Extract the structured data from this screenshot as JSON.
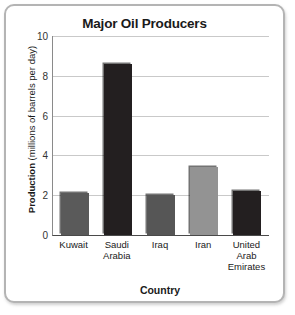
{
  "chart_data": {
    "type": "bar",
    "title": "Major Oil Producers",
    "xlabel": "Country",
    "ylabel": "Production (millions of barrels per day)",
    "ylabel_bold_part": "Production",
    "ylabel_rest": " (millions of barrels per day)",
    "categories": [
      "Kuwait",
      "Saudi Arabia",
      "Iraq",
      "Iran",
      "United Arab Emirates"
    ],
    "values": [
      2.1,
      8.6,
      2.0,
      3.4,
      2.2
    ],
    "bar_colors": [
      "#5a5a5a",
      "#231f20",
      "#565656",
      "#939393",
      "#231f20"
    ],
    "ylim": [
      0,
      10
    ],
    "yticks": [
      0,
      2,
      4,
      6,
      8,
      10
    ],
    "ytick_labels": [
      "0",
      "2",
      "4",
      "6",
      "8",
      "10"
    ],
    "grid": true,
    "legend": false,
    "frame_color": "#b4b4b4",
    "gridline_color": "#c9c9c9",
    "axis_color": "#4a4a4a"
  }
}
